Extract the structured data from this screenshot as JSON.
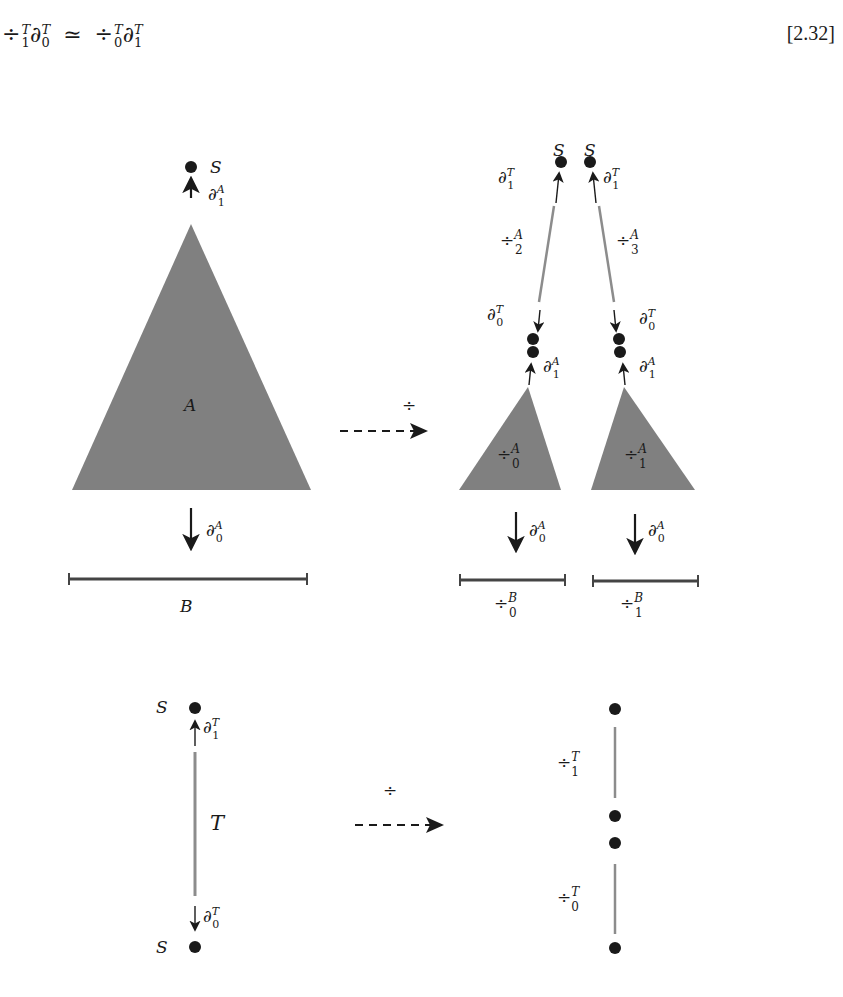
{
  "equation": {
    "lhs_op": "÷",
    "lhs_op_sup": "T",
    "lhs_op_sub": "1",
    "lhs_d": "∂",
    "lhs_d_sup": "T",
    "lhs_d_sub": "0",
    "relation": "≃",
    "rhs_op": "÷",
    "rhs_op_sup": "T",
    "rhs_op_sub": "0",
    "rhs_d": "∂",
    "rhs_d_sup": "T",
    "rhs_d_sub": "1",
    "number": "[2.32]"
  },
  "colors": {
    "shape_fill": "#808080",
    "line_gray": "#8c8c8c",
    "bar_dark": "#444444",
    "ink": "#1a1a1a"
  },
  "top_left": {
    "point_label": "S",
    "top_arrow": {
      "sym": "∂",
      "sup": "A",
      "sub": "1"
    },
    "triangle_label": "A",
    "bottom_arrow": {
      "sym": "∂",
      "sup": "A",
      "sub": "0"
    },
    "base_label": "B"
  },
  "top_arrow_mid": {
    "label": "÷"
  },
  "top_right": {
    "left_branch": {
      "point_label": "S",
      "top_arrow": {
        "sym": "∂",
        "sup": "T",
        "sub": "1"
      },
      "segment_label": {
        "sym": "÷",
        "sup": "A",
        "sub": "2"
      },
      "lower_arrow": {
        "sym": "∂",
        "sup": "T",
        "sub": "0"
      },
      "tri_arrow": {
        "sym": "∂",
        "sup": "A",
        "sub": "1"
      },
      "triangle_label": {
        "sym": "÷",
        "sup": "A",
        "sub": "0"
      },
      "bottom_arrow": {
        "sym": "∂",
        "sup": "A",
        "sub": "0"
      },
      "base_label": {
        "sym": "÷",
        "sup": "B",
        "sub": "0"
      }
    },
    "right_branch": {
      "point_label": "S",
      "top_arrow": {
        "sym": "∂",
        "sup": "T",
        "sub": "1"
      },
      "segment_label": {
        "sym": "÷",
        "sup": "A",
        "sub": "3"
      },
      "lower_arrow": {
        "sym": "∂",
        "sup": "T",
        "sub": "0"
      },
      "tri_arrow": {
        "sym": "∂",
        "sup": "A",
        "sub": "1"
      },
      "triangle_label": {
        "sym": "÷",
        "sup": "A",
        "sub": "1"
      },
      "bottom_arrow": {
        "sym": "∂",
        "sup": "A",
        "sub": "0"
      },
      "base_label": {
        "sym": "÷",
        "sup": "B",
        "sub": "1"
      }
    }
  },
  "bottom_left": {
    "top_point_label": "S",
    "top_arrow": {
      "sym": "∂",
      "sup": "T",
      "sub": "1"
    },
    "segment_label": "T",
    "bottom_arrow": {
      "sym": "∂",
      "sup": "T",
      "sub": "0"
    },
    "bottom_point_label": "S"
  },
  "bottom_arrow_mid": {
    "label": "÷"
  },
  "bottom_right": {
    "upper_segment_label": {
      "sym": "÷",
      "sup": "T",
      "sub": "1"
    },
    "lower_segment_label": {
      "sym": "÷",
      "sup": "T",
      "sub": "0"
    }
  }
}
